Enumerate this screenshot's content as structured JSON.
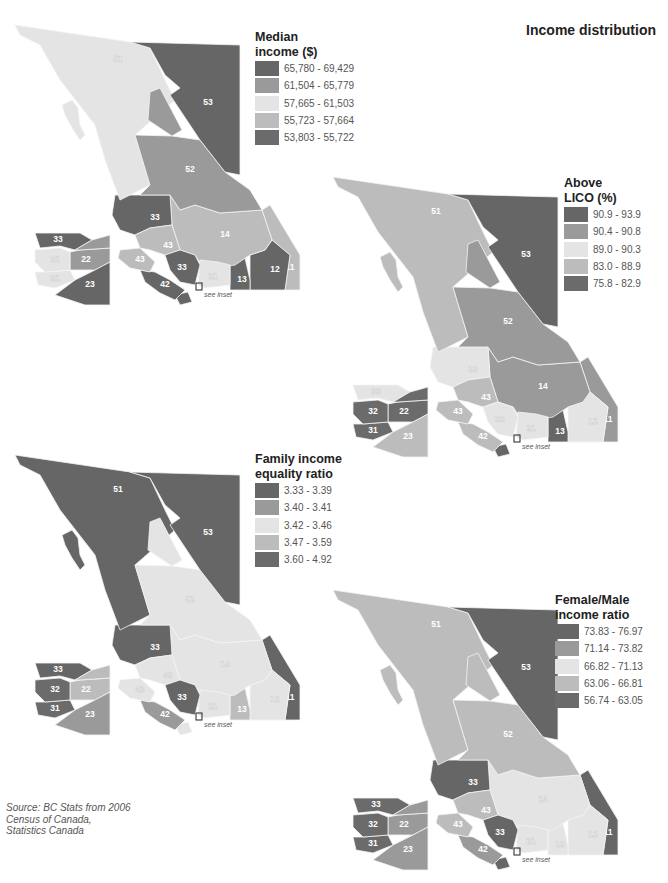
{
  "header": {
    "title": "Income distribution"
  },
  "source": {
    "lines": [
      "Source: BC Stats from 2006",
      "Census of Canada,",
      "Statistics Canada"
    ]
  },
  "see_inset_label": "see inset",
  "palette": {
    "class1": "#666666",
    "class2": "#9a9a9a",
    "class3": "#e4e4e4",
    "class4": "#bcbcbc",
    "class5": "#6b6b6b"
  },
  "maps": [
    {
      "id": "median-income",
      "legend": {
        "title_lines": [
          "Median",
          "income ($)"
        ],
        "classes": [
          "65,780 - 69,429",
          "61,504 - 65,779",
          "57,665 - 61,503",
          "55,723 - 57,664",
          "53,803 - 55,722"
        ]
      },
      "regions": {
        "53": 1,
        "51": 3,
        "52": 2,
        "54": 2,
        "33": 1,
        "14": 4,
        "43": 4,
        "42": 1,
        "41": 1,
        "21": 3,
        "13": 1,
        "12": 1,
        "11": 4,
        "33s": 1,
        "22": 2,
        "32": 3,
        "31": 3,
        "23": 1,
        "33i": 1
      }
    },
    {
      "id": "above-lico",
      "legend": {
        "title_lines": [
          "Above",
          "LICO (%)"
        ],
        "classes": [
          "90.9 - 93.9",
          "90.4 - 90.8",
          "89.0 - 90.3",
          "83.0 - 88.9",
          "75.8 - 82.9"
        ]
      },
      "regions": {
        "53": 1,
        "51": 4,
        "52": 2,
        "54": 2,
        "33": 3,
        "14": 2,
        "43": 4,
        "42": 4,
        "41": 1,
        "21": 3,
        "13": 1,
        "12": 3,
        "11": 2,
        "33s": 3,
        "22": 5,
        "32": 5,
        "31": 5,
        "23": 4,
        "33i": 3
      }
    },
    {
      "id": "family-income-equality",
      "legend": {
        "title_lines": [
          "Family income",
          "equality ratio"
        ],
        "classes": [
          "3.33 - 3.39",
          "3.40 - 3.41",
          "3.42 - 3.46",
          "3.47 - 3.59",
          "3.60 - 4.92"
        ]
      },
      "regions": {
        "53": 1,
        "51": 1,
        "52": 3,
        "54": 3,
        "33": 1,
        "14": 3,
        "43": 3,
        "42": 2,
        "41": 3,
        "21": 3,
        "13": 4,
        "12": 3,
        "11": 1,
        "33s": 1,
        "22": 4,
        "32": 5,
        "31": 5,
        "23": 2,
        "33i": 1
      }
    },
    {
      "id": "female-male-income-ratio",
      "legend": {
        "title_lines": [
          "Female/Male",
          "income ratio"
        ],
        "classes": [
          "73.83 - 76.97",
          "71.14 - 73.82",
          "66.82 - 71.13",
          "63.06 - 66.81",
          "56.74 - 63.05"
        ]
      },
      "regions": {
        "53": 1,
        "51": 4,
        "52": 4,
        "54": 4,
        "33": 1,
        "14": 3,
        "43": 4,
        "42": 2,
        "41": 1,
        "21": 3,
        "13": 3,
        "12": 3,
        "11": 1,
        "33s": 1,
        "22": 2,
        "32": 5,
        "31": 5,
        "23": 2,
        "33i": 5
      }
    }
  ],
  "region_labels": {
    "53": "53",
    "51": "51",
    "52": "52",
    "33": "33",
    "14": "14",
    "43": "43",
    "42": "42",
    "21": "21",
    "13": "13",
    "12": "12",
    "11": "11",
    "33s": "33",
    "22": "22",
    "32": "32",
    "31": "31",
    "23": "23",
    "33i": "33",
    "43b": "43"
  }
}
